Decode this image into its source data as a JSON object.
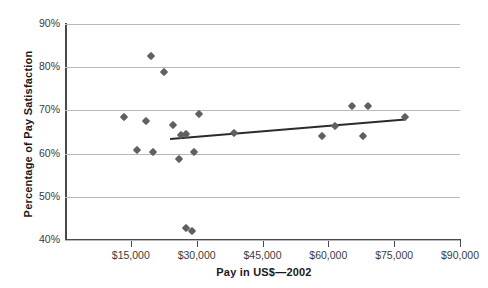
{
  "chart_data": {
    "type": "scatter",
    "title": "",
    "xlabel": "Pay in US$—2002",
    "ylabel": "Percentage of Pay Satisfaction",
    "xlim": [
      0,
      90000
    ],
    "ylim": [
      40,
      90
    ],
    "grid": true,
    "legend": false,
    "xticks": [
      15000,
      30000,
      45000,
      60000,
      75000,
      90000
    ],
    "xtick_labels": [
      "$15,000",
      "$30,000",
      "$45,000",
      "$60,000",
      "$75,000",
      "$90,000"
    ],
    "yticks": [
      40,
      50,
      60,
      70,
      80,
      90
    ],
    "ytick_labels": [
      "40%",
      "50%",
      "60%",
      "70%",
      "80%",
      "90%"
    ],
    "marker": "diamond",
    "marker_color": "#5f5f66",
    "points": [
      {
        "x": 13500,
        "y": 68.4
      },
      {
        "x": 16500,
        "y": 60.8
      },
      {
        "x": 18500,
        "y": 67.6
      },
      {
        "x": 19500,
        "y": 82.5
      },
      {
        "x": 20000,
        "y": 60.4
      },
      {
        "x": 22500,
        "y": 79.0
      },
      {
        "x": 24500,
        "y": 66.6
      },
      {
        "x": 26000,
        "y": 58.8
      },
      {
        "x": 26500,
        "y": 64.3
      },
      {
        "x": 27500,
        "y": 64.6
      },
      {
        "x": 27500,
        "y": 42.8
      },
      {
        "x": 29000,
        "y": 42.0
      },
      {
        "x": 29500,
        "y": 60.3
      },
      {
        "x": 30500,
        "y": 69.1
      },
      {
        "x": 38500,
        "y": 64.8
      },
      {
        "x": 58500,
        "y": 64.0
      },
      {
        "x": 61500,
        "y": 66.3
      },
      {
        "x": 65500,
        "y": 71.0
      },
      {
        "x": 69000,
        "y": 71.0
      },
      {
        "x": 68000,
        "y": 64.1
      },
      {
        "x": 77500,
        "y": 68.5
      }
    ],
    "trendline": {
      "type": "linear",
      "x_start": 24000,
      "y_start": 63.5,
      "x_end": 77500,
      "y_end": 68.0,
      "color": "#2b2b2b"
    }
  },
  "axes": {
    "ylabel": "Percentage of Pay Satisfaction",
    "xlabel": "Pay in US$—2002"
  }
}
